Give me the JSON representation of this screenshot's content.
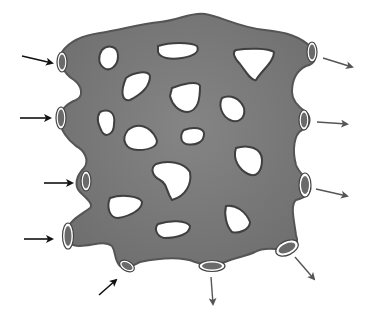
{
  "diagram": {
    "type": "porous-vascular-network",
    "colors": {
      "background": "#ffffff",
      "tissue_fill": "#7b7b7b",
      "tissue_edge": "#4a4a4a",
      "hole_fill": "#ffffff",
      "tube_inner": "#6a6a6a",
      "tube_ring": "#ffffff",
      "inflow_arrow": "#111111",
      "outflow_arrow": "#555555"
    },
    "inflow_arrows": [
      {
        "from": [
          22,
          56
        ],
        "to": [
          56,
          64
        ]
      },
      {
        "from": [
          20,
          118
        ],
        "to": [
          53,
          118
        ]
      },
      {
        "from": [
          44,
          183
        ],
        "to": [
          73,
          183
        ]
      },
      {
        "from": [
          24,
          238
        ],
        "to": [
          52,
          238
        ]
      },
      {
        "from": [
          99,
          295
        ],
        "to": [
          118,
          279
        ]
      }
    ],
    "outflow_arrows": [
      {
        "from": [
          323,
          58
        ],
        "to": [
          352,
          66
        ]
      },
      {
        "from": [
          317,
          122
        ],
        "to": [
          347,
          124
        ]
      },
      {
        "from": [
          316,
          189
        ],
        "to": [
          347,
          197
        ]
      },
      {
        "from": [
          294,
          256
        ],
        "to": [
          315,
          280
        ]
      },
      {
        "from": [
          211,
          276
        ],
        "to": [
          213,
          305
        ]
      }
    ]
  }
}
